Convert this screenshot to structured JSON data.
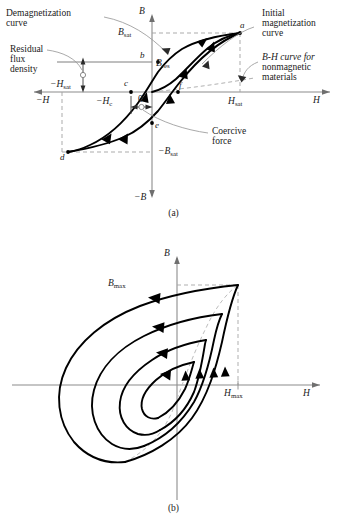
{
  "figure": {
    "panels": [
      {
        "id": "a",
        "caption": "(a)",
        "axis_labels": {
          "b_pos": "B",
          "b_neg": "−B",
          "h_pos": "H",
          "h_neg": "−H"
        },
        "tick_labels": [
          {
            "name": "b-sat",
            "text": "B",
            "sub": "sat"
          },
          {
            "name": "b-sat-neg",
            "text": "−B",
            "sub": "sat"
          },
          {
            "name": "h-sat",
            "text": "H",
            "sub": "sat"
          },
          {
            "name": "h-sat-neg",
            "text": "−H",
            "sub": "sat"
          },
          {
            "name": "h-c-neg",
            "text": "−H",
            "sub": "c"
          },
          {
            "name": "b-res",
            "text": "B",
            "sub": "res"
          },
          {
            "name": "origin",
            "text": "0",
            "sub": ""
          }
        ],
        "point_labels": [
          "a",
          "b",
          "c",
          "d",
          "e",
          "f"
        ],
        "annotations": [
          {
            "name": "demagnetization-curve",
            "lines": [
              "Demagnetization",
              "curve"
            ]
          },
          {
            "name": "residual-flux-density",
            "lines": [
              "Residual",
              "flux",
              "density"
            ]
          },
          {
            "name": "initial-magnetization-curve",
            "lines": [
              "Initial",
              "magnetization",
              "curve"
            ]
          },
          {
            "name": "bh-curve-nonmagnetic",
            "lines": [
              "B-H curve for",
              "nonmagnetic",
              "materials"
            ]
          },
          {
            "name": "coercive-force",
            "lines": [
              "Coercive",
              "force"
            ]
          }
        ]
      },
      {
        "id": "b",
        "caption": "(b)",
        "axis_labels": {
          "b_pos": "B",
          "h_pos": "H"
        },
        "tick_labels": [
          {
            "name": "b-max",
            "text": "B",
            "sub": "max"
          },
          {
            "name": "h-max",
            "text": "H",
            "sub": "max"
          }
        ],
        "loop_count": 4
      }
    ],
    "colors": {
      "curve": "#000000",
      "axis": "#808080",
      "dashed": "#9a9a9a",
      "leader": "#8a8a8a",
      "text": "#1a1a1a"
    }
  }
}
